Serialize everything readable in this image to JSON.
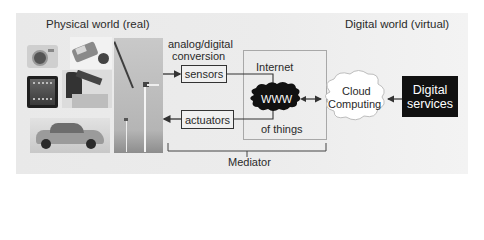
{
  "diagram": {
    "title_left": "Physical world (real)",
    "title_right": "Digital world (virtual)",
    "conversion_label_line1": "analog/digital",
    "conversion_label_line2": "conversion",
    "sensors_label": "sensors",
    "actuators_label": "actuators",
    "internet_label": "Internet",
    "www_label": "WWW",
    "of_things_label": "of things",
    "cloud_line1": "Cloud",
    "cloud_line2": "Computing",
    "digital_services_line1": "Digital",
    "digital_services_line2": "services",
    "mediator_label": "Mediator",
    "photos": [
      "camera",
      "wearable-gadget",
      "tablet",
      "industrial-robot",
      "car",
      "wind-turbines"
    ],
    "colors": {
      "background_panel": "#ececec",
      "text": "#2a2a2a",
      "box_border": "#333333",
      "internet_border": "#a8a8a8",
      "www_cloud": "#111111",
      "digital_services_bg": "#111111",
      "digital_services_text": "#ffffff",
      "cloud_fill": "#ffffff"
    }
  }
}
